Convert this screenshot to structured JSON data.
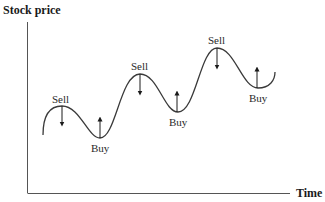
{
  "diagram": {
    "y_axis_label": "Stock price",
    "x_axis_label": "Time",
    "colors": {
      "line": "#3a3a3a",
      "axis": "#555555",
      "text": "#1a1a1a"
    },
    "signals": [
      {
        "label": "Sell",
        "type": "peak",
        "direction": "down"
      },
      {
        "label": "Buy",
        "type": "trough",
        "direction": "up"
      },
      {
        "label": "Sell",
        "type": "peak",
        "direction": "down"
      },
      {
        "label": "Buy",
        "type": "trough",
        "direction": "up"
      },
      {
        "label": "Sell",
        "type": "peak",
        "direction": "down"
      },
      {
        "label": "Buy",
        "type": "trough",
        "direction": "up"
      }
    ]
  }
}
